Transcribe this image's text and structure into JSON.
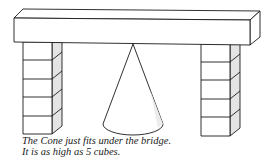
{
  "figure": {
    "objects": {
      "beam": {
        "label": "bridge"
      },
      "left_column": {
        "label": "column of cubes",
        "cube_count": 5
      },
      "right_column": {
        "label": "column of cubes",
        "cube_count": 5
      },
      "cone": {
        "label": "cone"
      }
    },
    "colors": {
      "stroke": "#1a1a1a",
      "shade": "#d8d8d8",
      "fill": "#ffffff"
    }
  },
  "caption": {
    "line1": "The Cone just fits under the bridge.",
    "line2": "It is as high as 5 cubes."
  }
}
